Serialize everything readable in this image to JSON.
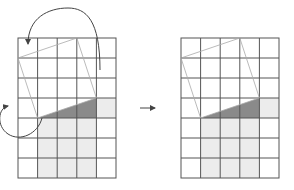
{
  "diagram": {
    "grid": {
      "columns": 5,
      "rows": 7
    },
    "colors": {
      "grid_line": "#555555",
      "tilted_square": "#aaaaaa",
      "dark_triangle": "#8a8a8a",
      "light_fill": "#ececec",
      "arrow": "#444444"
    },
    "panels": [
      {
        "name": "before",
        "has_rotation_arrows": true
      },
      {
        "name": "after",
        "has_rotation_arrows": false
      }
    ],
    "transition_arrow": "right-arrow"
  }
}
